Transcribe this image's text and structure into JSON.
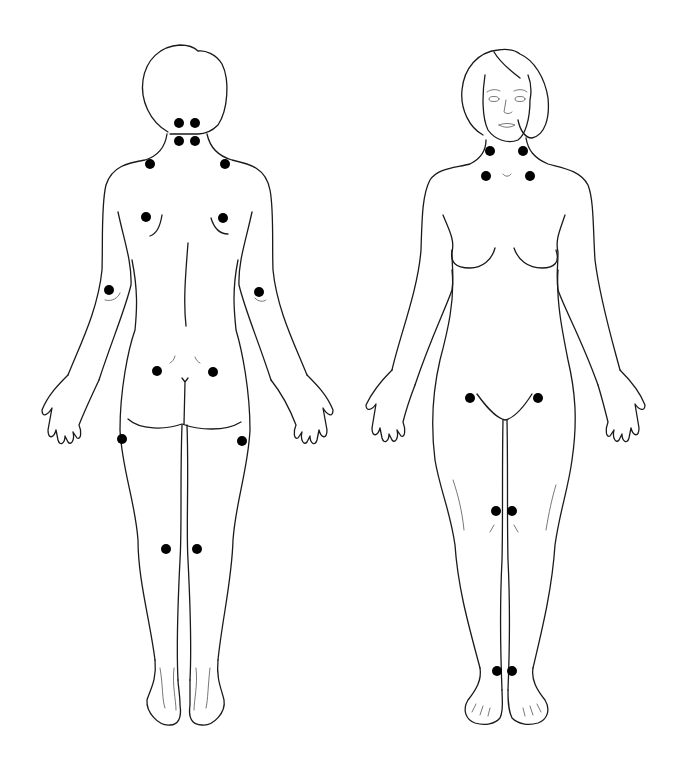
{
  "diagram": {
    "type": "body-map",
    "figures": [
      {
        "id": "back-view",
        "view": "posterior",
        "tender_points": [
          {
            "name": "occiput-left-upper",
            "x": 179,
            "y": 123
          },
          {
            "name": "occiput-right-upper",
            "x": 195,
            "y": 123
          },
          {
            "name": "occiput-left-lower",
            "x": 179,
            "y": 141
          },
          {
            "name": "occiput-right-lower",
            "x": 195,
            "y": 141
          },
          {
            "name": "trapezius-left",
            "x": 150,
            "y": 164
          },
          {
            "name": "trapezius-right",
            "x": 225,
            "y": 164
          },
          {
            "name": "supraspinatus-left",
            "x": 146,
            "y": 217
          },
          {
            "name": "supraspinatus-right",
            "x": 223,
            "y": 218
          },
          {
            "name": "lateral-epicondyle-left",
            "x": 109,
            "y": 290
          },
          {
            "name": "lateral-epicondyle-right",
            "x": 259,
            "y": 292
          },
          {
            "name": "gluteal-left",
            "x": 157,
            "y": 371
          },
          {
            "name": "gluteal-right",
            "x": 213,
            "y": 372
          },
          {
            "name": "greater-trochanter-left",
            "x": 122,
            "y": 439
          },
          {
            "name": "greater-trochanter-right",
            "x": 242,
            "y": 441
          },
          {
            "name": "knee-back-left",
            "x": 166,
            "y": 549
          },
          {
            "name": "knee-back-right",
            "x": 197,
            "y": 549
          }
        ]
      },
      {
        "id": "front-view",
        "view": "anterior",
        "tender_points": [
          {
            "name": "low-cervical-left",
            "x": 490,
            "y": 151
          },
          {
            "name": "low-cervical-right",
            "x": 523,
            "y": 151
          },
          {
            "name": "second-rib-left",
            "x": 486,
            "y": 176
          },
          {
            "name": "second-rib-right",
            "x": 530,
            "y": 176
          },
          {
            "name": "hip-front-left",
            "x": 470,
            "y": 398
          },
          {
            "name": "hip-front-right",
            "x": 538,
            "y": 398
          },
          {
            "name": "knee-medial-left",
            "x": 496,
            "y": 511
          },
          {
            "name": "knee-medial-right",
            "x": 512,
            "y": 511
          },
          {
            "name": "ankle-left",
            "x": 497,
            "y": 671
          },
          {
            "name": "ankle-right",
            "x": 512,
            "y": 671
          }
        ]
      }
    ],
    "dot_color": "#000000",
    "line_color": "#1a1a1a",
    "background": "#ffffff"
  }
}
